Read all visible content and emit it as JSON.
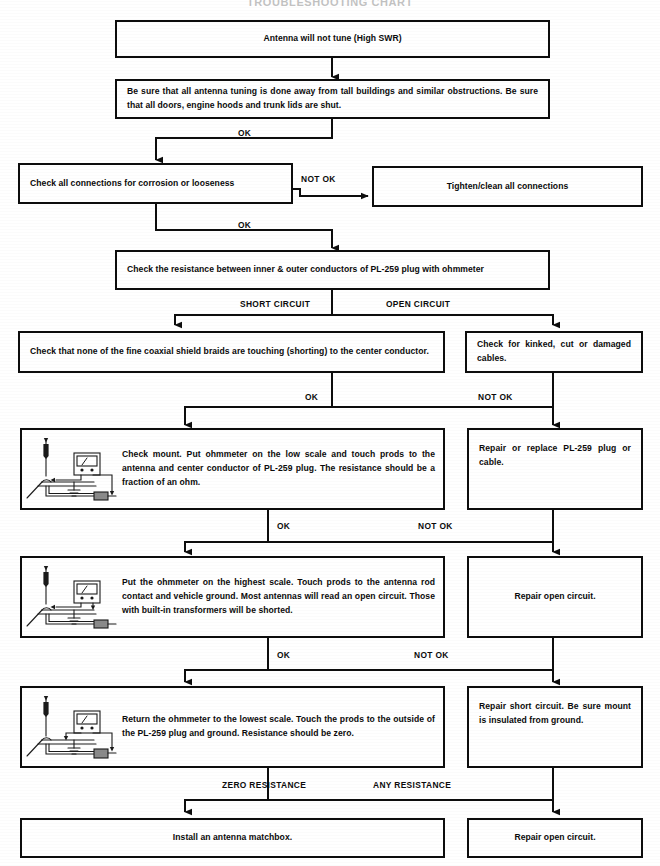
{
  "document": {
    "title": "TROUBLESHOOTING CHART"
  },
  "nodes": {
    "start": "Antenna will not tune (High SWR)",
    "precheck": "Be sure that all antenna tuning is done away from tall buildings and similar obstructions. Be sure that all doors, engine hoods and trunk lids are shut.",
    "check_connections": "Check all connections for corrosion or looseness",
    "tighten_connections": "Tighten/clean all connections",
    "check_resistance": "Check the resistance between inner & outer conductors of PL-259 plug with ohmmeter",
    "check_braids": "Check that none of the fine coaxial shield braids are touching (shorting) to the center conductor.",
    "check_cables": "Check for kinked, cut or damaged cables.",
    "check_mount": "Check mount. Put ohmmeter on the low scale and touch prods to the antenna and center conductor of PL-259 plug. The resistance should be a fraction of an ohm.",
    "repair_plug": "Repair or replace PL-259 plug or cable.",
    "highest_scale": "Put the ohmmeter on the highest scale. Touch prods to the antenna rod contact and vehicle ground. Most antennas will read an open circuit. Those with built-in transformers will be shorted.",
    "repair_open_1": "Repair open circuit.",
    "lowest_scale": "Return the ohmmeter to the lowest scale. Touch the prods to the outside of the PL-259 plug and ground. Resistance should be zero.",
    "repair_short": "Repair short circuit. Be sure mount is insulated from ground.",
    "install_matchbox": "Install an antenna matchbox.",
    "repair_open_2": "Repair open circuit."
  },
  "edge_labels": {
    "ok_1": "OK",
    "not_ok_1": "NOT OK",
    "ok_2": "OK",
    "short_circuit": "SHORT CIRCUIT",
    "open_circuit": "OPEN CIRCUIT",
    "ok_3": "OK",
    "not_ok_3": "NOT OK",
    "ok_4": "OK",
    "not_ok_4": "NOT OK",
    "ok_5": "OK",
    "not_ok_5": "NOT OK",
    "zero_resistance": "ZERO RESISTANCE",
    "any_resistance": "ANY RESISTANCE"
  },
  "illustration": {
    "name": "antenna-ohmmeter-diagram",
    "caption_parts": [
      "antenna rod",
      "ohmmeter",
      "vehicle mount",
      "ground symbol",
      "coax cable",
      "PL-259 plug"
    ]
  },
  "colors": {
    "ink": "#0d0d0d",
    "paper": "#ffffff"
  }
}
